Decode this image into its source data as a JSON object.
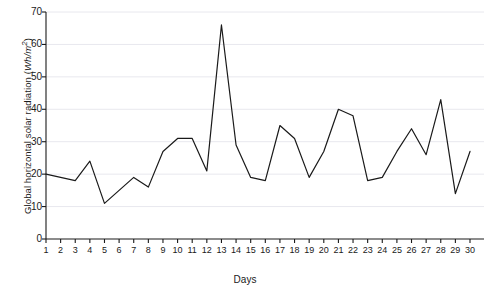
{
  "chart_data": {
    "type": "line",
    "title": "",
    "xlabel": "Days",
    "ylabel": "Global horizontal solar radiation (Wh/m²)",
    "ylabel_plain": "Global horizontal solar radiation (",
    "ylabel_italic": "Wh/m",
    "ylabel_sup": "2",
    "ylabel_tail": ")",
    "x": [
      1,
      2,
      3,
      4,
      5,
      6,
      7,
      8,
      9,
      10,
      11,
      12,
      13,
      14,
      15,
      16,
      17,
      18,
      19,
      20,
      21,
      22,
      23,
      24,
      25,
      26,
      27,
      28,
      29,
      30
    ],
    "categories": [
      "1",
      "2",
      "3",
      "4",
      "5",
      "6",
      "7",
      "8",
      "9",
      "10",
      "11",
      "12",
      "13",
      "14",
      "15",
      "16",
      "17",
      "18",
      "19",
      "20",
      "21",
      "22",
      "23",
      "24",
      "25",
      "26",
      "27",
      "28",
      "29",
      "30"
    ],
    "values": [
      20,
      19,
      18,
      24,
      11,
      15,
      19,
      16,
      27,
      31,
      31,
      21,
      66,
      29,
      19,
      18,
      35,
      31,
      19,
      27,
      40,
      38,
      18,
      19,
      27,
      34,
      26,
      43,
      14,
      27
    ],
    "series": [
      {
        "name": "Global horizontal solar radiation",
        "values": [
          20,
          19,
          18,
          24,
          11,
          15,
          19,
          16,
          27,
          31,
          31,
          21,
          66,
          29,
          19,
          18,
          35,
          31,
          19,
          27,
          40,
          38,
          18,
          19,
          27,
          34,
          26,
          43,
          14,
          27
        ],
        "color": "#1a1a1a"
      }
    ],
    "ylim": [
      0,
      70
    ],
    "xlim": [
      1,
      30
    ],
    "yticks": [
      0,
      10,
      20,
      30,
      40,
      50,
      60,
      70
    ],
    "ytick_labels": [
      "0",
      "10",
      "20",
      "30",
      "40",
      "50",
      "60",
      "70"
    ],
    "xticks": [
      1,
      2,
      3,
      4,
      5,
      6,
      7,
      8,
      9,
      10,
      11,
      12,
      13,
      14,
      15,
      16,
      17,
      18,
      19,
      20,
      21,
      22,
      23,
      24,
      25,
      26,
      27,
      28,
      29,
      30
    ],
    "grid": "horizontal-light",
    "grid_color": "#e8e8ee",
    "legend": "none",
    "line_color": "#1a1a1a",
    "line_width": 1.2,
    "axis_color": "#1a1a1a",
    "background": "#ffffff"
  }
}
